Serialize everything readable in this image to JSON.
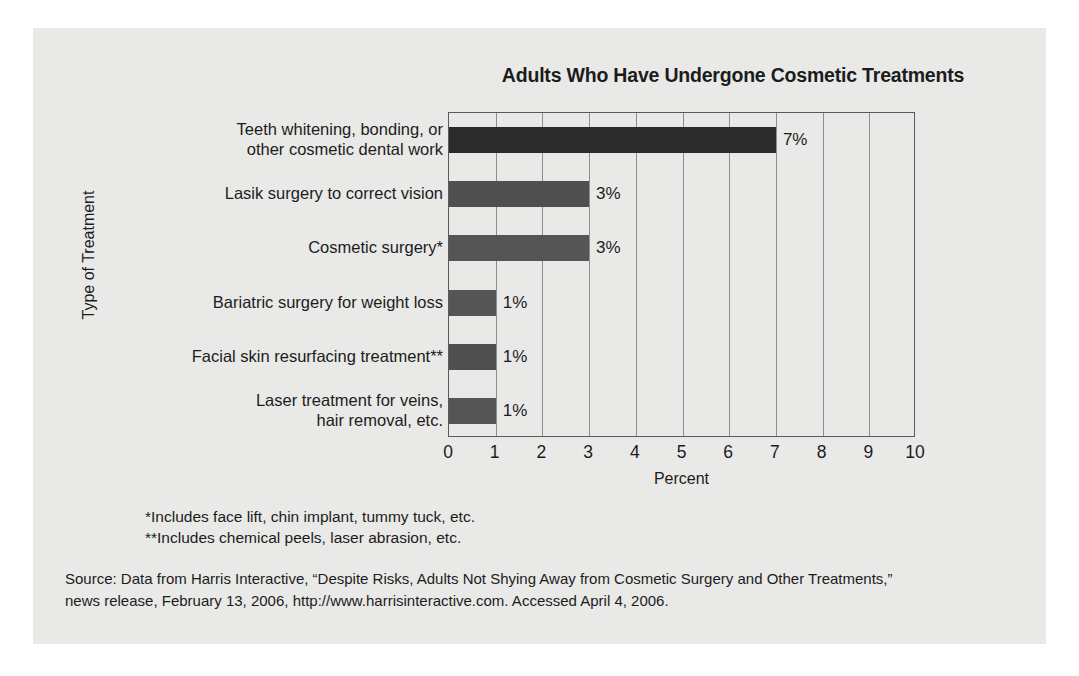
{
  "card": {
    "background": "#e9e9e7"
  },
  "chart_data": {
    "type": "bar",
    "orientation": "horizontal",
    "title": "Adults Who Have Undergone Cosmetic Treatments",
    "xlabel": "Percent",
    "ylabel": "Type of Treatment",
    "xlim": [
      0,
      10
    ],
    "xticks": [
      "0",
      "1",
      "2",
      "3",
      "4",
      "5",
      "6",
      "7",
      "8",
      "9",
      "10"
    ],
    "grid": "vertical",
    "legend": "none",
    "categories": [
      "Teeth whitening, bonding, or other cosmetic dental work",
      "Lasik surgery to correct vision",
      "Cosmetic surgery*",
      "Bariatric surgery for weight loss",
      "Facial skin resurfacing treatment**",
      "Laser treatment for veins, hair removal, etc."
    ],
    "category_lines": [
      [
        "Teeth whitening, bonding, or",
        "other cosmetic dental work"
      ],
      [
        "Lasik surgery to correct vision"
      ],
      [
        "Cosmetic surgery*"
      ],
      [
        "Bariatric surgery for weight loss"
      ],
      [
        "Facial skin resurfacing treatment**"
      ],
      [
        "Laser treatment for veins,",
        "hair removal, etc."
      ]
    ],
    "values": [
      7,
      3,
      3,
      1,
      1,
      1
    ],
    "value_labels": [
      "7%",
      "3%",
      "3%",
      "1%",
      "1%",
      "1%"
    ],
    "bar_colors": [
      "#2b2b2b",
      "#4f4f4f",
      "#555555",
      "#555555",
      "#4f4f4f",
      "#555555"
    ]
  },
  "footnotes": [
    "*Includes face lift, chin implant, tummy tuck, etc.",
    "**Includes chemical peels, laser abrasion, etc."
  ],
  "source": {
    "line1": "Source: Data from Harris Interactive, “Despite Risks, Adults Not Shying Away from Cosmetic Surgery and Other Treatments,”",
    "line2": "news release, February 13, 2006, http://www.harrisinteractive.com. Accessed April 4, 2006."
  }
}
